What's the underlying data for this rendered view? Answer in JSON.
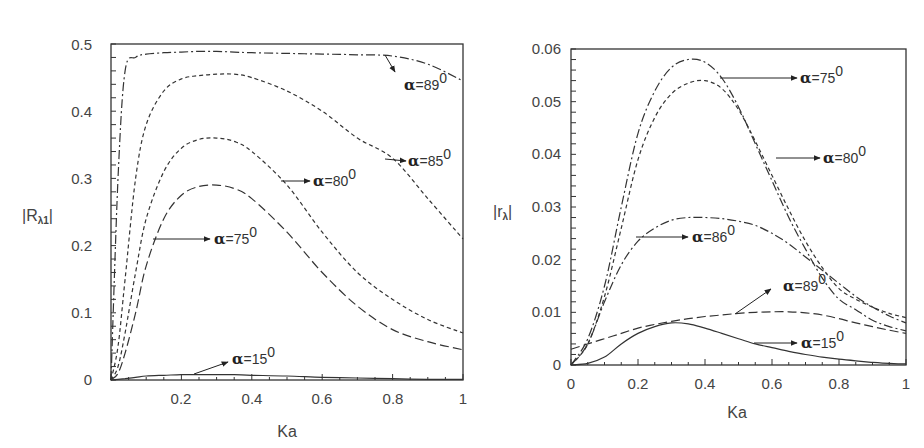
{
  "chart_data": [
    {
      "type": "line",
      "title": "",
      "xlabel": "Ka",
      "ylabel": "|Rλ1|",
      "xlim": [
        0,
        1
      ],
      "ylim": [
        0,
        0.5
      ],
      "xticks": [
        "0.2",
        "0.4",
        "0.6",
        "0.8",
        "1"
      ],
      "yticks": [
        "0",
        "0.1",
        "0.2",
        "0.3",
        "0.4",
        "0.5"
      ],
      "grid": false,
      "legend": "inline annotations with arrows",
      "x": [
        0,
        0.02,
        0.04,
        0.07,
        0.1,
        0.15,
        0.2,
        0.25,
        0.3,
        0.35,
        0.4,
        0.5,
        0.6,
        0.7,
        0.8,
        0.9,
        1.0
      ],
      "series": [
        {
          "name": "α=89⁰",
          "style": "dash-dot",
          "values": [
            0,
            0.3,
            0.46,
            0.48,
            0.485,
            0.487,
            0.488,
            0.489,
            0.489,
            0.488,
            0.487,
            0.486,
            0.485,
            0.484,
            0.482,
            0.47,
            0.445
          ]
        },
        {
          "name": "α=85⁰",
          "style": "short-dash",
          "values": [
            0,
            0.05,
            0.15,
            0.3,
            0.38,
            0.43,
            0.448,
            0.453,
            0.455,
            0.455,
            0.45,
            0.43,
            0.4,
            0.36,
            0.33,
            0.27,
            0.21
          ]
        },
        {
          "name": "α=80⁰",
          "style": "short-dash",
          "values": [
            0,
            0.02,
            0.07,
            0.16,
            0.24,
            0.31,
            0.345,
            0.358,
            0.36,
            0.355,
            0.34,
            0.29,
            0.22,
            0.16,
            0.12,
            0.09,
            0.07
          ]
        },
        {
          "name": "α=75⁰",
          "style": "long-dash",
          "values": [
            0,
            0.01,
            0.04,
            0.1,
            0.17,
            0.24,
            0.275,
            0.288,
            0.29,
            0.285,
            0.27,
            0.22,
            0.16,
            0.11,
            0.075,
            0.057,
            0.045
          ]
        },
        {
          "name": "α=15⁰",
          "style": "solid",
          "values": [
            0,
            0.001,
            0.002,
            0.004,
            0.006,
            0.007,
            0.008,
            0.008,
            0.008,
            0.008,
            0.007,
            0.006,
            0.004,
            0.003,
            0.002,
            0.001,
            0.001
          ]
        }
      ],
      "annotations": [
        "α=89⁰",
        "α=85⁰",
        "α=80⁰",
        "α=75⁰",
        "α=15⁰"
      ]
    },
    {
      "type": "line",
      "title": "",
      "xlabel": "Ka",
      "ylabel": "|rλ|",
      "xlim": [
        0,
        1
      ],
      "ylim": [
        0,
        0.06
      ],
      "xticks": [
        "0",
        "0.2",
        "0.4",
        "0.6",
        "0.8",
        "1"
      ],
      "yticks": [
        "0",
        "0.01",
        "0.02",
        "0.03",
        "0.04",
        "0.05",
        "0.06"
      ],
      "grid": false,
      "legend": "inline annotations with arrows",
      "x": [
        0,
        0.05,
        0.1,
        0.15,
        0.2,
        0.25,
        0.3,
        0.35,
        0.4,
        0.45,
        0.5,
        0.55,
        0.6,
        0.65,
        0.7,
        0.75,
        0.8,
        0.85,
        0.9,
        0.95,
        1.0
      ],
      "series": [
        {
          "name": "α=75⁰",
          "style": "dash-dot",
          "values": [
            0,
            0.005,
            0.015,
            0.03,
            0.044,
            0.052,
            0.0565,
            0.058,
            0.0575,
            0.0545,
            0.049,
            0.042,
            0.035,
            0.028,
            0.022,
            0.0165,
            0.0125,
            0.0105,
            0.0085,
            0.0073,
            0.0065
          ]
        },
        {
          "name": "α=80⁰",
          "style": "short-dash",
          "values": [
            0,
            0.004,
            0.013,
            0.026,
            0.039,
            0.047,
            0.0515,
            0.0535,
            0.054,
            0.0525,
            0.0485,
            0.0425,
            0.036,
            0.0295,
            0.0235,
            0.0185,
            0.0145,
            0.0125,
            0.011,
            0.0098,
            0.009
          ]
        },
        {
          "name": "α=86⁰",
          "style": "dash-dot",
          "values": [
            0,
            0.004,
            0.012,
            0.019,
            0.0235,
            0.026,
            0.0275,
            0.028,
            0.028,
            0.0278,
            0.0273,
            0.0265,
            0.025,
            0.023,
            0.0205,
            0.018,
            0.0155,
            0.013,
            0.011,
            0.0093,
            0.008
          ]
        },
        {
          "name": "α=89⁰",
          "style": "long-dash",
          "values": [
            0.003,
            0.004,
            0.005,
            0.006,
            0.007,
            0.0077,
            0.0083,
            0.0088,
            0.0092,
            0.0095,
            0.0098,
            0.01,
            0.0101,
            0.0101,
            0.0099,
            0.0095,
            0.0088,
            0.008,
            0.0073,
            0.0066,
            0.006
          ]
        },
        {
          "name": "α=15⁰",
          "style": "solid",
          "values": [
            0,
            0.0003,
            0.0015,
            0.004,
            0.006,
            0.0073,
            0.008,
            0.0078,
            0.007,
            0.006,
            0.005,
            0.004,
            0.0033,
            0.0026,
            0.002,
            0.0015,
            0.0011,
            0.0008,
            0.0005,
            0.0003,
            0.0002
          ]
        }
      ],
      "annotations": [
        "α=75⁰",
        "α=80⁰",
        "α=86⁰",
        "α=89⁰",
        "α=15⁰"
      ]
    }
  ],
  "left": {
    "ylabel": "|R",
    "ylabel_sub": "λ1",
    "ylabel_end": "|",
    "xlabel": "Ka",
    "yticks": [
      "0",
      "0.1",
      "0.2",
      "0.3",
      "0.4",
      "0.5"
    ],
    "xticks": [
      "0.2",
      "0.4",
      "0.6",
      "0.8",
      "1"
    ],
    "labels": {
      "a89": "=89",
      "a85": "=85",
      "a80": "=80",
      "a75": "=75",
      "a15": "=15"
    }
  },
  "right": {
    "ylabel": "|r",
    "ylabel_sub": "λ",
    "ylabel_end": "|",
    "xlabel": "Ka",
    "yticks": [
      "0",
      "0.01",
      "0.02",
      "0.03",
      "0.04",
      "0.05",
      "0.06"
    ],
    "xticks": [
      "0",
      "0.2",
      "0.4",
      "0.6",
      "0.8",
      "1"
    ],
    "labels": {
      "a75": "=75",
      "a80": "=80",
      "a86": "=86",
      "a89": "=89",
      "a15": "=15"
    }
  },
  "symbols": {
    "alpha": "α",
    "degree": "0"
  }
}
